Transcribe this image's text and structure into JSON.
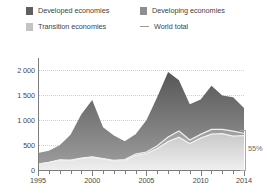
{
  "legend": {
    "items": [
      {
        "label": "Developed economies",
        "icon": "square-swatch-icon",
        "color": "#5f5f5f",
        "row": 0,
        "col": 0
      },
      {
        "label": "Developing economies",
        "icon": "square-swatch-icon",
        "color": "#8e8e8e",
        "row": 0,
        "col": 1
      },
      {
        "label": "Transition economies",
        "icon": "square-swatch-icon",
        "color": "#c3c3c3",
        "row": 1,
        "col": 0
      },
      {
        "label": "World total",
        "icon": "line-swatch-icon",
        "color": "#9a9a9a",
        "row": 1,
        "col": 1
      }
    ]
  },
  "annotation": {
    "percent_label": "55%",
    "bracket_name": "developing-share-bracket"
  },
  "chart_data": {
    "type": "area",
    "stacked": true,
    "title": "",
    "xlabel": "",
    "ylabel": "",
    "grid": true,
    "legend_position": "top",
    "xlim": [
      1995,
      2014
    ],
    "ylim": [
      0,
      2250
    ],
    "yticks": [
      0,
      500,
      1000,
      1500,
      2000
    ],
    "ytick_labels": [
      "0",
      "500",
      "1 000",
      "1 500",
      "2 000"
    ],
    "xticks": [
      1995,
      2000,
      2005,
      2010,
      2014
    ],
    "xtick_labels": [
      "1995",
      "2000",
      "2005",
      "2010",
      "2014"
    ],
    "x": [
      1995,
      1996,
      1997,
      1998,
      1999,
      2000,
      2001,
      2002,
      2003,
      2004,
      2005,
      2006,
      2007,
      2008,
      2009,
      2010,
      2011,
      2012,
      2013,
      2014
    ],
    "series": [
      {
        "name": "Developing economies",
        "color": "#c3c3c3",
        "values": [
          115,
          150,
          195,
          190,
          230,
          255,
          220,
          180,
          190,
          290,
          330,
          430,
          570,
          660,
          530,
          640,
          720,
          730,
          680,
          690
        ]
      },
      {
        "name": "Transition economies",
        "color": "#9d9d9d",
        "values": [
          5,
          6,
          10,
          8,
          10,
          9,
          11,
          13,
          20,
          30,
          31,
          57,
          91,
          123,
          73,
          75,
          95,
          85,
          100,
          48
        ]
      },
      {
        "name": "Developed economies",
        "color": "#5f5f5f",
        "values": [
          220,
          230,
          290,
          510,
          880,
          1140,
          630,
          500,
          370,
          400,
          640,
          980,
          1310,
          1020,
          720,
          700,
          880,
          680,
          680,
          510
        ]
      }
    ],
    "world_total": {
      "name": "World total",
      "color": "#efefef",
      "values": [
        340,
        386,
        495,
        708,
        1120,
        1404,
        861,
        693,
        580,
        720,
        1001,
        1467,
        1971,
        1803,
        1323,
        1415,
        1695,
        1495,
        1460,
        1248
      ]
    }
  }
}
